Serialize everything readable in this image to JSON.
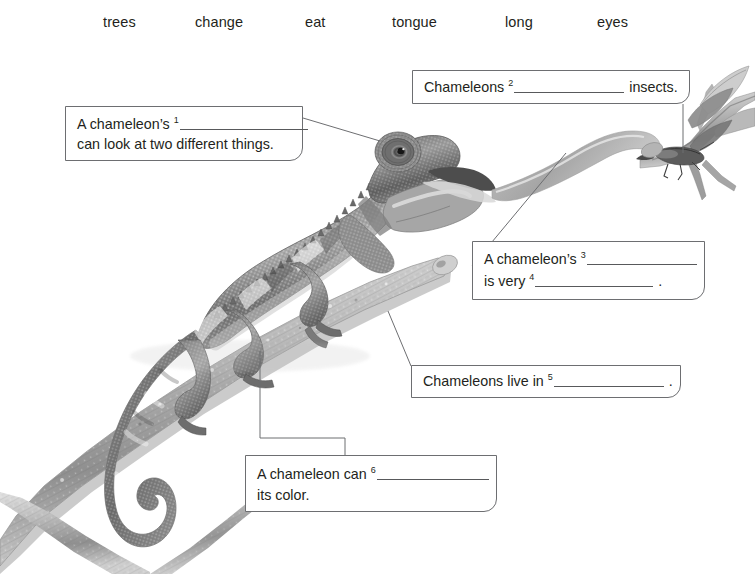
{
  "word_bank": {
    "words": [
      {
        "text": "trees",
        "x": 103
      },
      {
        "text": "change",
        "x": 195
      },
      {
        "text": "eat",
        "x": 305
      },
      {
        "text": "tongue",
        "x": 392
      },
      {
        "text": "long",
        "x": 505
      },
      {
        "text": "eyes",
        "x": 597
      }
    ]
  },
  "callouts": [
    {
      "id": "callout-1",
      "x": 65,
      "y": 106,
      "w": 238,
      "h": 55,
      "lines": [
        {
          "top": 6,
          "parts": [
            {
              "type": "text",
              "value": "A chameleon’s "
            },
            {
              "type": "sup",
              "value": "1"
            },
            {
              "type": "blank",
              "width": 128
            }
          ]
        },
        {
          "top": 26,
          "parts": [
            {
              "type": "text",
              "value": "can look at two different things."
            }
          ]
        }
      ]
    },
    {
      "id": "callout-2",
      "x": 412,
      "y": 70,
      "w": 278,
      "h": 34,
      "lines": [
        {
          "top": 5,
          "parts": [
            {
              "type": "text",
              "value": "Chameleons "
            },
            {
              "type": "sup",
              "value": "2"
            },
            {
              "type": "blank",
              "width": 110
            },
            {
              "type": "text",
              "value": " insects."
            }
          ]
        }
      ]
    },
    {
      "id": "callout-3",
      "x": 472,
      "y": 241,
      "w": 233,
      "h": 59,
      "lines": [
        {
          "top": 6,
          "parts": [
            {
              "type": "text",
              "value": "A chameleon’s "
            },
            {
              "type": "sup",
              "value": "3"
            },
            {
              "type": "blank",
              "width": 110
            }
          ]
        },
        {
          "top": 28,
          "parts": [
            {
              "type": "text",
              "value": "is very "
            },
            {
              "type": "sup",
              "value": "4"
            },
            {
              "type": "blank",
              "width": 118
            },
            {
              "type": "text",
              "value": " ."
            }
          ]
        }
      ]
    },
    {
      "id": "callout-4",
      "x": 411,
      "y": 365,
      "w": 270,
      "h": 33,
      "lines": [
        {
          "top": 4,
          "parts": [
            {
              "type": "text",
              "value": "Chameleons live in "
            },
            {
              "type": "sup",
              "value": "5"
            },
            {
              "type": "blank",
              "width": 110
            },
            {
              "type": "text",
              "value": " ."
            }
          ]
        }
      ]
    },
    {
      "id": "callout-5",
      "x": 245,
      "y": 455,
      "w": 252,
      "h": 57,
      "lines": [
        {
          "top": 7,
          "parts": [
            {
              "type": "text",
              "value": "A chameleon can "
            },
            {
              "type": "sup",
              "value": "6"
            },
            {
              "type": "blank",
              "width": 112
            }
          ]
        },
        {
          "top": 28,
          "parts": [
            {
              "type": "text",
              "value": "its color."
            }
          ]
        }
      ]
    }
  ],
  "leader_lines": [
    {
      "name": "leader-eyes",
      "points": "303,118 380,141"
    },
    {
      "name": "leader-eat",
      "points": "683,104 683,153"
    },
    {
      "name": "leader-tongue",
      "points": "472,266 566,153"
    },
    {
      "name": "leader-trees",
      "points": "411,366 388,311"
    },
    {
      "name": "leader-change",
      "points": "260,351 260,438 345,438 345,455"
    }
  ],
  "colors": {
    "text": "#231f20",
    "box_border": "#6d6e71",
    "leader_line": "#6d6e71",
    "blank_rule": "#58595b",
    "background": "#ffffff",
    "photo_gray_dark": "#4a4a4a",
    "photo_gray_mid": "#8e8e8e",
    "photo_gray_light": "#c9c9c9"
  },
  "photo": {
    "subject": "chameleon-photo",
    "description": "grayscale photograph of a chameleon gripping a branch with its tongue extended toward an insect"
  }
}
